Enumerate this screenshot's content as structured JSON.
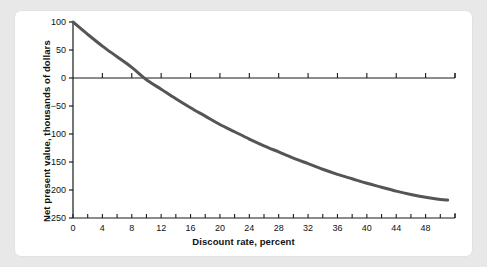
{
  "figure": {
    "background_color": "#e8e8e8",
    "card_color": "#ffffff",
    "curve_color": "#555555",
    "axis_color": "#1a1a1a"
  },
  "chart_data": {
    "type": "line",
    "title": "",
    "xlabel": "Discount rate, percent",
    "ylabel": "Net present value, thousands of dollars",
    "xlim": [
      0,
      52
    ],
    "ylim": [
      -250,
      100
    ],
    "grid": false,
    "legend": null,
    "xticks": [
      0,
      4,
      8,
      12,
      16,
      20,
      24,
      28,
      32,
      36,
      40,
      44,
      48
    ],
    "xtick_labels": [
      "0",
      "4",
      "8",
      "12",
      "16",
      "20",
      "24",
      "28",
      "32",
      "36",
      "40",
      "44",
      "48"
    ],
    "xminor_step": 2,
    "yticks": [
      100,
      50,
      0,
      -50,
      -100,
      -150,
      -200,
      -250
    ],
    "ytick_labels": [
      "100",
      "50",
      "0",
      "−50",
      "−100",
      "−150",
      "−200",
      "−250"
    ],
    "zero_line": true,
    "series": [
      {
        "name": "Net present value",
        "color": "#555555",
        "x": [
          0,
          2,
          4,
          6,
          8,
          10,
          12,
          14,
          16,
          18,
          20,
          22,
          24,
          26,
          28,
          30,
          32,
          34,
          36,
          38,
          40,
          42,
          44,
          46,
          48,
          50,
          51
        ],
        "values": [
          100,
          78,
          57,
          38,
          19,
          -3,
          -20,
          -37,
          -53,
          -68,
          -83,
          -96,
          -109,
          -121,
          -132,
          -143,
          -153,
          -163,
          -172,
          -180,
          -188,
          -195,
          -202,
          -208,
          -213,
          -217,
          -218
        ]
      }
    ],
    "annotations": [
      {
        "label": "zero crossing (IRR)",
        "x": 9.5,
        "y": 0
      }
    ]
  }
}
